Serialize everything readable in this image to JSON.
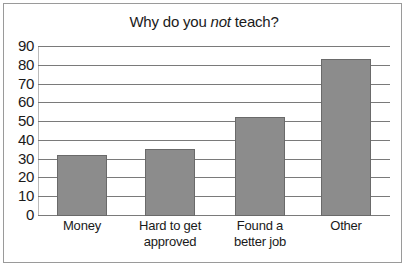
{
  "chart_data": {
    "type": "bar",
    "title": "Why do you not teach?",
    "title_parts": {
      "before": "Why do you ",
      "emphasis": "not",
      "after": " teach?"
    },
    "categories": [
      "Money",
      "Hard to get approved",
      "Found a better job",
      "Other"
    ],
    "category_lines": [
      [
        "Money"
      ],
      [
        "Hard to get",
        "approved"
      ],
      [
        "Found a",
        "better job"
      ],
      [
        "Other"
      ]
    ],
    "values": [
      32,
      35,
      52,
      83
    ],
    "xlabel": "",
    "ylabel": "",
    "ylim": [
      0,
      90
    ],
    "yticks": [
      0,
      10,
      20,
      30,
      40,
      50,
      60,
      70,
      80,
      90
    ],
    "grid": true,
    "legend": null,
    "bar_color": "#8c8c8c"
  }
}
